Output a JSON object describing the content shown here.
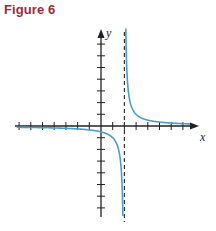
{
  "figure": {
    "title": "Figure 6",
    "title_color": "#9b2b3a"
  },
  "chart_data": {
    "type": "line",
    "title": "Figure 6",
    "xlabel": "x",
    "ylabel": "y",
    "function": "y = 1/(x - 2)",
    "vertical_asymptote": 2,
    "horizontal_asymptote": 0,
    "xlim": [
      -7.3,
      8.2
    ],
    "ylim": [
      -7.7,
      8.2
    ],
    "x_ticks": [
      -7,
      -6,
      -5,
      -4,
      -3,
      -2,
      -1,
      1,
      2,
      3,
      4,
      5,
      6,
      7
    ],
    "y_ticks": [
      -7,
      -6,
      -5,
      -4,
      -3,
      -2,
      -1,
      1,
      2,
      3,
      4,
      5,
      6,
      7
    ],
    "tick_labels_shown": false,
    "grid": false,
    "series": [
      {
        "name": "left branch",
        "color": "#4a9cc9",
        "x": [
          -7.2,
          -6,
          -5,
          -4,
          -3,
          -2,
          -1,
          0,
          0.5,
          1,
          1.5,
          1.7,
          1.8,
          1.87
        ],
        "y": [
          -0.11,
          -0.125,
          -0.143,
          -0.167,
          -0.2,
          -0.25,
          -0.333,
          -0.5,
          -0.667,
          -1,
          -2,
          -3.33,
          -5,
          -7.7
        ]
      },
      {
        "name": "right branch",
        "color": "#4a9cc9",
        "x": [
          2.12,
          2.15,
          2.2,
          2.3,
          2.5,
          3,
          4,
          5,
          6,
          7,
          7.6
        ],
        "y": [
          8.2,
          6.67,
          5,
          3.33,
          2,
          1,
          0.5,
          0.333,
          0.25,
          0.2,
          0.18
        ]
      }
    ],
    "asymptote_style": "dashed",
    "asymptote_color": "#333333"
  }
}
